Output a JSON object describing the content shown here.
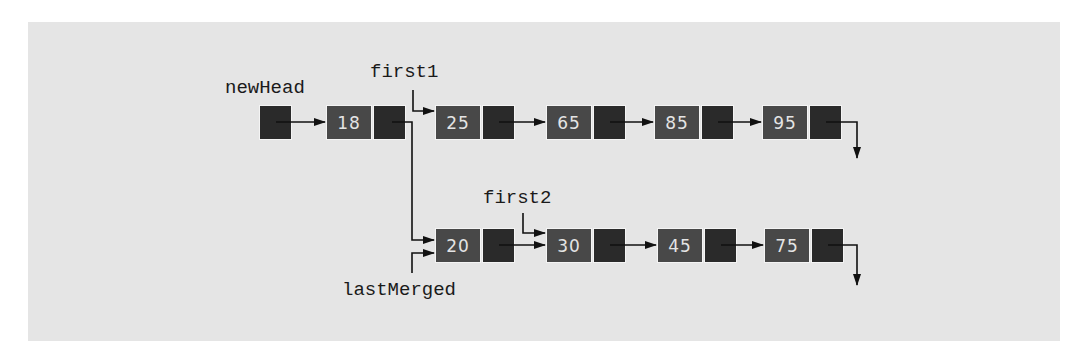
{
  "figure": {
    "background": "#e5e5e5",
    "node_data_color": "#484848",
    "node_pointer_color": "#2a2a2a"
  },
  "labels": {
    "new_head": "newHead",
    "first1": "first1",
    "first2": "first2",
    "last_merged": "lastMerged"
  },
  "merged_list": {
    "nodes": [
      {
        "value": "18"
      }
    ]
  },
  "list1": {
    "nodes": [
      {
        "value": "25"
      },
      {
        "value": "65"
      },
      {
        "value": "85"
      },
      {
        "value": "95"
      }
    ]
  },
  "list2": {
    "nodes": [
      {
        "value": "20"
      },
      {
        "value": "30"
      },
      {
        "value": "45"
      },
      {
        "value": "75"
      }
    ]
  }
}
